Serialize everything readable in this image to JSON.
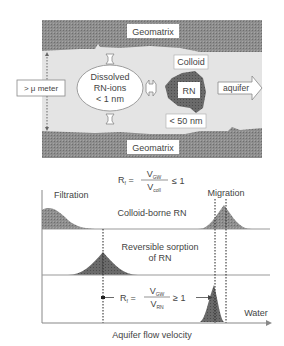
{
  "top_diagram": {
    "geomatrix_top": "Geomatrix",
    "geomatrix_bottom": "Geomatrix",
    "aperture_label": "> μ meter",
    "dissolved": [
      "Dissolved",
      "RN-ions",
      "< 1 nm"
    ],
    "colloid_label": "Colloid",
    "colloid_core": "RN",
    "colloid_size": "< 50 nm",
    "flow_arrow": "aquifer"
  },
  "bottom_chart": {
    "formula_top": {
      "lhs": "R",
      "lhs_sub": "f",
      "num": "V",
      "num_sub": "GW",
      "den": "V",
      "den_sub": "coll",
      "rel": "≤ 1"
    },
    "formula_bottom": {
      "lhs": "R",
      "lhs_sub": "f",
      "num": "V",
      "num_sub": "GW",
      "den": "V",
      "den_sub": "RN",
      "rel": "≥ 1"
    },
    "filtration": "Filtration",
    "migration": "Migration",
    "row1_label": "Colloid-borne RN",
    "row2_label": [
      "Reversible sorption",
      "of RN"
    ],
    "water_label": "Water",
    "xlabel": "Aquifer flow velocity"
  },
  "colors": {
    "matrix": "#8a8a8a",
    "pore": "#e6e6e6",
    "peak_dark": "#5a5a5a",
    "peak_mid": "#7d7d7d",
    "line": "#9a9a9a"
  }
}
